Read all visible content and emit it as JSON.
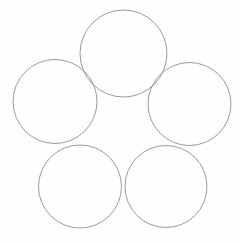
{
  "figure": {
    "title": "Five overlapping circles arranged in a rosette",
    "background_color": "#fefefe",
    "stroke_color": "#8f8f93",
    "stroke_width": 0.9,
    "canvas": {
      "width": 241,
      "height": 242
    },
    "shape_count": 5
  },
  "chart_data": {
    "type": "scatter",
    "title": "Five overlapping circles arranged in a rosette",
    "xlabel": "",
    "ylabel": "",
    "xlim": [
      0,
      241
    ],
    "ylim": [
      0,
      242
    ],
    "grid": false,
    "legend": "none",
    "shape": "circle",
    "units": "pixels",
    "categories": [
      "top",
      "left",
      "right",
      "bottom-left",
      "bottom-right"
    ],
    "circles": [
      {
        "name": "top",
        "cx": 123.5,
        "cy": 53.5,
        "r": 43.5
      },
      {
        "name": "left",
        "cx": 55.0,
        "cy": 101.5,
        "r": 42.0
      },
      {
        "name": "right",
        "cx": 189.5,
        "cy": 104.0,
        "r": 41.5
      },
      {
        "name": "bottom-left",
        "cx": 80.0,
        "cy": 186.5,
        "r": 41.5
      },
      {
        "name": "bottom-right",
        "cx": 166.0,
        "cy": 186.5,
        "r": 41.0
      }
    ]
  }
}
